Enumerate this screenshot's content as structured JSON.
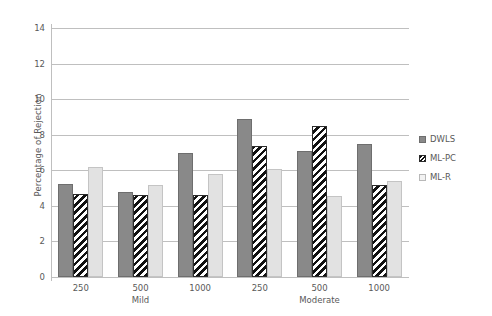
{
  "chart_data": {
    "type": "bar",
    "title": "",
    "xlabel": "",
    "ylabel": "Percentage of Rejection",
    "ylim": [
      0,
      14
    ],
    "yticks": [
      0,
      2,
      4,
      6,
      8,
      10,
      12,
      14
    ],
    "grid": true,
    "legend_position": "right",
    "categories": [
      "250",
      "500",
      "1000",
      "250",
      "500",
      "1000"
    ],
    "groups": [
      {
        "name": "Mild",
        "categories": [
          "250",
          "500",
          "1000"
        ]
      },
      {
        "name": "Moderate",
        "categories": [
          "250",
          "500",
          "1000"
        ]
      }
    ],
    "series": [
      {
        "name": "DWLS",
        "values": [
          5.25,
          4.8,
          6.95,
          8.9,
          7.1,
          7.5
        ]
      },
      {
        "name": "ML-PC",
        "values": [
          4.65,
          4.6,
          4.6,
          7.35,
          8.5,
          5.2
        ]
      },
      {
        "name": "ML-R",
        "values": [
          6.2,
          5.2,
          5.8,
          6.1,
          4.55,
          5.4
        ]
      }
    ],
    "colors": {
      "DWLS": "#898989",
      "ML-PC": "#111111",
      "ML-R": "#e2e2e2",
      "gridline": "#bfbfbf",
      "text": "#595959",
      "background": "#ffffff"
    }
  },
  "legend": {
    "items": [
      {
        "label": "DWLS",
        "swatch": "dwls-swatch-icon"
      },
      {
        "label": "ML-PC",
        "swatch": "mlpc-swatch-icon"
      },
      {
        "label": "ML-R",
        "swatch": "mlr-swatch-icon"
      }
    ]
  }
}
